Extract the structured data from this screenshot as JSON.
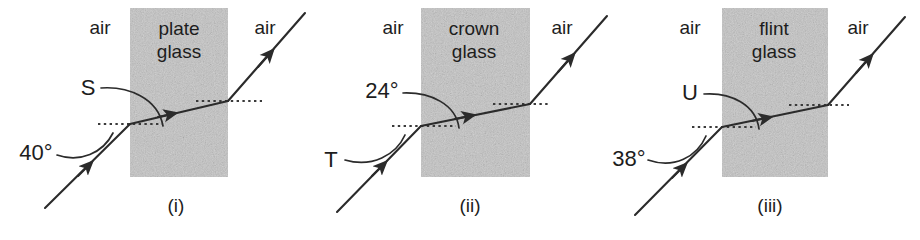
{
  "figure": {
    "background_color": "#ffffff",
    "ink_color": "#2b2b2b",
    "block_color": "#c3c3c3",
    "width": 920,
    "height": 240
  },
  "panels": [
    {
      "caption": "(i)",
      "material": "plate\nglass",
      "material_line1": "plate",
      "material_line2": "glass",
      "air_left": "air",
      "air_right": "air",
      "incidence_label": "40°",
      "refraction_label": "S",
      "incidence_value": 40,
      "incidence_unit": "degrees",
      "refraction_value": null,
      "refraction_is_unknown": true
    },
    {
      "caption": "(ii)",
      "material": "crown\nglass",
      "material_line1": "crown",
      "material_line2": "glass",
      "air_left": "air",
      "air_right": "air",
      "incidence_label": "T",
      "refraction_label": "24°",
      "incidence_value": null,
      "incidence_is_unknown": true,
      "refraction_value": 24,
      "refraction_unit": "degrees"
    },
    {
      "caption": "(iii)",
      "material": "flint\nglass",
      "material_line1": "flint",
      "material_line2": "glass",
      "air_left": "air",
      "air_right": "air",
      "incidence_label": "38°",
      "refraction_label": "U",
      "incidence_value": 38,
      "incidence_unit": "degrees",
      "refraction_value": null,
      "refraction_is_unknown": true
    }
  ],
  "annotations": {
    "normal_line_style": "dotted",
    "normal_line_meaning": "horizontal reference line at the glass surface",
    "ray_direction": "lower-left to upper-right",
    "arrow_count_per_panel": 3
  }
}
